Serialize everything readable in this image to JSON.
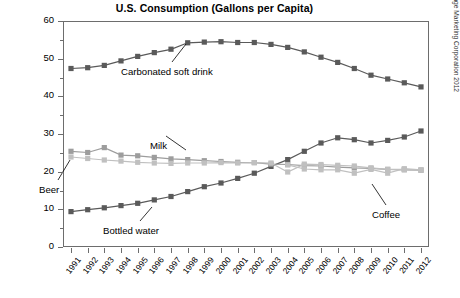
{
  "chart_data": {
    "type": "line",
    "title": "U.S. Consumption (Gallons per Capita)",
    "xlabel": "",
    "ylabel": "",
    "ylim": [
      0,
      60
    ],
    "yticks": [
      0,
      10,
      20,
      30,
      40,
      50,
      60
    ],
    "ytick_labels": [
      "0",
      "10",
      "20",
      "30",
      "40",
      "50",
      "60"
    ],
    "yminor_step": 5,
    "grid": false,
    "legend": "inline-annotations",
    "x": [
      1991,
      1992,
      1993,
      1994,
      1995,
      1996,
      1997,
      1998,
      1999,
      2000,
      2001,
      2002,
      2003,
      2004,
      2005,
      2006,
      2007,
      2008,
      2009,
      2010,
      2011,
      2012
    ],
    "categories": [
      "1991",
      "1992",
      "1993",
      "1994",
      "1995",
      "1996",
      "1997",
      "1998",
      "1999",
      "2000",
      "2001",
      "2002",
      "2003",
      "2004",
      "2005",
      "2006",
      "2007",
      "2008",
      "2009",
      "2010",
      "2011",
      "2012"
    ],
    "series": [
      {
        "name": "Carbonated soft drink",
        "color": "#5a5a5a",
        "marker": "square",
        "values": [
          47.4,
          47.6,
          48.2,
          49.4,
          50.6,
          51.6,
          52.5,
          54.2,
          54.4,
          54.5,
          54.3,
          54.3,
          53.8,
          53.0,
          51.8,
          50.4,
          49.0,
          47.4,
          45.6,
          44.6,
          43.6,
          42.5
        ]
      },
      {
        "name": "Bottled water",
        "color": "#5a5a5a",
        "marker": "square",
        "values": [
          9.4,
          9.9,
          10.4,
          11.0,
          11.6,
          12.5,
          13.4,
          14.7,
          16.0,
          17.0,
          18.2,
          19.6,
          21.4,
          23.2,
          25.4,
          27.6,
          29.0,
          28.5,
          27.6,
          28.3,
          29.2,
          30.8
        ]
      },
      {
        "name": "Milk",
        "color": "#9d9d9d",
        "marker": "square",
        "values": [
          25.4,
          25.1,
          26.4,
          24.4,
          24.2,
          23.8,
          23.4,
          23.2,
          22.9,
          22.7,
          22.5,
          22.4,
          22.0,
          21.9,
          21.6,
          21.5,
          21.2,
          21.0,
          20.9,
          20.6,
          20.5,
          20.4
        ]
      },
      {
        "name": "Beer",
        "color": "#c0c0c0",
        "marker": "square",
        "values": [
          23.9,
          23.5,
          23.1,
          22.8,
          22.5,
          22.3,
          22.2,
          22.3,
          22.3,
          22.4,
          22.3,
          22.4,
          22.3,
          19.9,
          22.0,
          21.9,
          21.7,
          21.5,
          21.0,
          20.6,
          20.6,
          20.4
        ]
      },
      {
        "name": "Coffee",
        "color": "#c0c0c0",
        "marker": "square",
        "values": [
          null,
          null,
          null,
          null,
          null,
          null,
          null,
          null,
          null,
          null,
          null,
          null,
          null,
          21.8,
          20.7,
          20.5,
          20.5,
          19.6,
          20.6,
          19.6,
          20.8,
          20.5
        ]
      }
    ],
    "annotations": [
      {
        "label": "Carbonated soft drink",
        "x": 121,
        "y": 66
      },
      {
        "label": "Milk",
        "x": 150,
        "y": 140
      },
      {
        "label": "Beer",
        "x": 39,
        "y": 184
      },
      {
        "label": "Bottled water",
        "x": 103,
        "y": 225
      },
      {
        "label": "Coffee",
        "x": 372,
        "y": 209
      }
    ],
    "source": "Source: Beverage Marketing Corporation 2012"
  }
}
